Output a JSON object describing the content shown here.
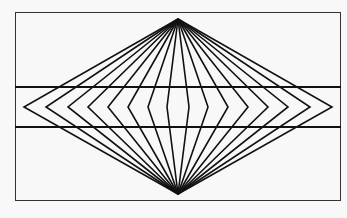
{
  "figure": {
    "line_color": "#111111",
    "background_color": "#f8f8f8",
    "radiating_line_pairs_per_side": 8,
    "horizontal_line_count": 2
  }
}
